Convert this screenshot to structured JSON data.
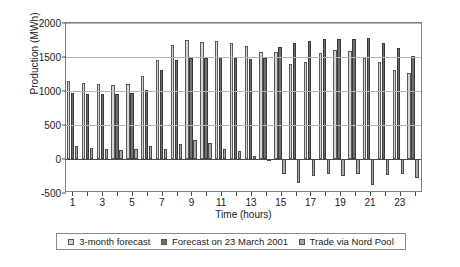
{
  "chart_data": {
    "type": "bar",
    "title": "",
    "xlabel": "Time (hours)",
    "ylabel": "Production (MWh)",
    "ylim": [
      -500,
      2000
    ],
    "yticks": [
      2000,
      1500,
      1000,
      500,
      0,
      -500
    ],
    "ytick_labels": [
      "2000",
      "1500",
      "1000",
      "500",
      "0",
      "-500"
    ],
    "grid": true,
    "legend_position": "bottom",
    "categories": [
      1,
      2,
      3,
      4,
      5,
      6,
      7,
      8,
      9,
      10,
      11,
      12,
      13,
      14,
      15,
      16,
      17,
      18,
      19,
      20,
      21,
      22,
      23,
      24
    ],
    "xtick_labels": [
      "1",
      "3",
      "5",
      "7",
      "9",
      "11",
      "13",
      "15",
      "17",
      "19",
      "21",
      "23"
    ],
    "series": [
      {
        "name": "3-month forecast",
        "color": "#d4d4d4",
        "values": [
          1150,
          1115,
          1100,
          1085,
          1110,
          1215,
          1450,
          1680,
          1755,
          1720,
          1735,
          1700,
          1660,
          1570,
          1580,
          1400,
          1420,
          1560,
          1600,
          1590,
          1490,
          1430,
          1310,
          1260
        ]
      },
      {
        "name": "Forecast on 23 March 2001",
        "color": "#6f6f6f",
        "values": [
          965,
          950,
          955,
          960,
          965,
          1015,
          1310,
          1460,
          1480,
          1490,
          1500,
          1490,
          1475,
          1490,
          1650,
          1700,
          1730,
          1760,
          1760,
          1760,
          1775,
          1710,
          1630,
          1510
        ]
      },
      {
        "name": "Trade via Nord Pool",
        "color": "#a9a9a9",
        "values": [
          185,
          165,
          150,
          135,
          150,
          195,
          140,
          220,
          285,
          240,
          150,
          120,
          40,
          -25,
          -225,
          -355,
          -250,
          -220,
          -245,
          -215,
          -375,
          -235,
          -225,
          -285
        ]
      }
    ]
  },
  "legend": {
    "items": [
      {
        "label": "3-month forecast",
        "icon": "square-swatch-light"
      },
      {
        "label": "Forecast on 23 March 2001",
        "icon": "square-swatch-dark"
      },
      {
        "label": "Trade via Nord Pool",
        "icon": "square-swatch-medium"
      }
    ]
  }
}
